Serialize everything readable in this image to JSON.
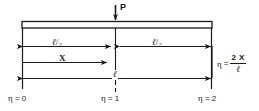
{
  "figure": {
    "type": "simply-supported-beam-loading-diagram",
    "background_color": "#ffffff",
    "line_color": "#1a1a1a"
  },
  "load": {
    "label": "P",
    "direction": "downward",
    "position": "midspan"
  },
  "beam": {
    "shape": "hollow-rectangle",
    "left_px": 22,
    "right_px": 212,
    "top_px": 21,
    "bottom_px": 28
  },
  "dimensions": [
    {
      "name": "half-span-left",
      "numerator": "ℓ",
      "slash": "/",
      "denominator": "2",
      "arrows": "both"
    },
    {
      "name": "half-span-right",
      "numerator": "ℓ",
      "slash": "/",
      "denominator": "2",
      "arrows": "both"
    },
    {
      "name": "coordinate-x",
      "label": "X",
      "arrows": "right"
    },
    {
      "name": "full-span",
      "label": "ℓ",
      "arrows": "both"
    }
  ],
  "equation": {
    "symbol": "η",
    "equals": "=",
    "numerator": "2 X",
    "denominator": "ℓ"
  },
  "stations": [
    {
      "name": "station-left",
      "symbol": "η",
      "equals": "=",
      "value": "0"
    },
    {
      "name": "station-center",
      "symbol": "η",
      "equals": "=",
      "value": "1"
    },
    {
      "name": "station-right",
      "symbol": "η",
      "equals": "=",
      "value": "2"
    }
  ]
}
